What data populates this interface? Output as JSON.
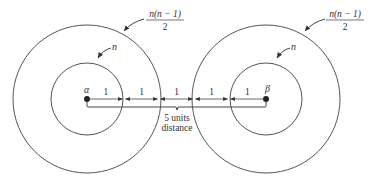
{
  "diagram": {
    "nodes": [
      {
        "id": "alpha",
        "label": "α"
      },
      {
        "id": "beta",
        "label": "β"
      }
    ],
    "inner_circle_label": "n",
    "outer_circle_label_numerator": "n(n − 1)",
    "outer_circle_label_denominator": "2",
    "segment_labels": [
      "1",
      "1",
      "1",
      "1",
      "1"
    ],
    "distance_label_line1": "5 units",
    "distance_label_line2": "distance",
    "colors": {
      "ink": "#333333",
      "background": "#ffffff"
    }
  }
}
